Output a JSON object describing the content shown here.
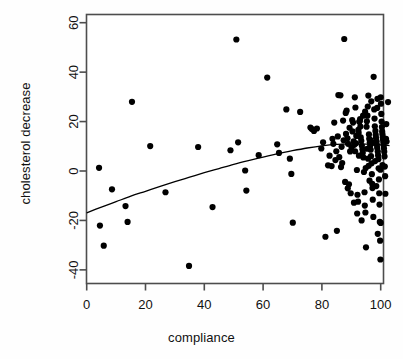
{
  "chart_data": {
    "type": "scatter",
    "title": "",
    "xlabel": "compliance",
    "ylabel": "cholesterol decrease",
    "xlim": [
      -4,
      106
    ],
    "ylim": [
      -45,
      66
    ],
    "xticks": [
      0,
      20,
      40,
      60,
      80,
      100
    ],
    "yticks": [
      -40,
      -20,
      0,
      20,
      40,
      60
    ],
    "grid": false,
    "legend": null,
    "point_color": "#000000",
    "point_size": 3.1,
    "curve_color": "#000000",
    "curve_label": "fitted smooth trend",
    "points": [
      [
        4.2,
        1.3
      ],
      [
        5.8,
        -30.2
      ],
      [
        4.5,
        -22.1
      ],
      [
        8.6,
        -7.4
      ],
      [
        13.2,
        -14.2
      ],
      [
        13.9,
        -20.6
      ],
      [
        15.4,
        28.0
      ],
      [
        21.6,
        10.1
      ],
      [
        26.8,
        -8.6
      ],
      [
        34.8,
        -38.4
      ],
      [
        37.9,
        9.7
      ],
      [
        42.8,
        -14.6
      ],
      [
        48.9,
        8.4
      ],
      [
        50.9,
        53.2
      ],
      [
        51.5,
        11.6
      ],
      [
        53.9,
        0.2
      ],
      [
        54.3,
        -7.9
      ],
      [
        58.5,
        6.4
      ],
      [
        61.4,
        37.8
      ],
      [
        64.8,
        10.8
      ],
      [
        65.4,
        7.3
      ],
      [
        67.9,
        24.9
      ],
      [
        69.1,
        5.0
      ],
      [
        69.6,
        -1.2
      ],
      [
        70.1,
        -20.9
      ],
      [
        72.6,
        23.9
      ],
      [
        76.1,
        17.6
      ],
      [
        76.6,
        17.0
      ],
      [
        77.3,
        16.2
      ],
      [
        78.3,
        17.2
      ],
      [
        79.8,
        9.1
      ],
      [
        80.4,
        11.6
      ],
      [
        81.2,
        -26.6
      ],
      [
        82.1,
        2.3
      ],
      [
        82.6,
        6.2
      ],
      [
        83.3,
        2.0
      ],
      [
        83.9,
        11.0
      ],
      [
        84.2,
        19.6
      ],
      [
        84.6,
        4.4
      ],
      [
        85.1,
        -24.2
      ],
      [
        85.6,
        30.7
      ],
      [
        86.3,
        30.6
      ],
      [
        86.5,
        1.6
      ],
      [
        87.2,
        20.4
      ],
      [
        87.6,
        53.4
      ],
      [
        88.1,
        23.5
      ],
      [
        88.4,
        24.4
      ],
      [
        88.7,
        13.2
      ],
      [
        88.9,
        11.0
      ],
      [
        89.2,
        -5.4
      ],
      [
        89.6,
        7.9
      ],
      [
        90.1,
        9.6
      ],
      [
        90.3,
        20.6
      ],
      [
        90.6,
        19.6
      ],
      [
        90.8,
        12.0
      ],
      [
        91.0,
        10.6
      ],
      [
        91.2,
        29.8
      ],
      [
        91.4,
        25.7
      ],
      [
        91.6,
        11.2
      ],
      [
        91.9,
        0.4
      ],
      [
        92.1,
        -9.6
      ],
      [
        92.3,
        -12.4
      ],
      [
        92.5,
        15.4
      ],
      [
        92.7,
        19.9
      ],
      [
        92.9,
        20.2
      ],
      [
        93.0,
        21.0
      ],
      [
        93.2,
        13.6
      ],
      [
        93.4,
        12.2
      ],
      [
        93.6,
        10.2
      ],
      [
        93.8,
        8.8
      ],
      [
        93.9,
        7.4
      ],
      [
        94.1,
        5.5
      ],
      [
        94.3,
        -0.4
      ],
      [
        94.5,
        -8.6
      ],
      [
        94.6,
        -14.0
      ],
      [
        94.8,
        -16.8
      ],
      [
        95.0,
        -30.9
      ],
      [
        95.2,
        17.9
      ],
      [
        95.3,
        20.1
      ],
      [
        95.5,
        22.4
      ],
      [
        95.6,
        26.1
      ],
      [
        95.8,
        30.5
      ],
      [
        96.0,
        14.8
      ],
      [
        96.1,
        13.0
      ],
      [
        96.3,
        11.6
      ],
      [
        96.4,
        10.1
      ],
      [
        96.6,
        8.6
      ],
      [
        96.7,
        6.0
      ],
      [
        96.9,
        3.1
      ],
      [
        97.0,
        -1.3
      ],
      [
        97.2,
        -6.9
      ],
      [
        97.3,
        -11.6
      ],
      [
        97.5,
        -18.6
      ],
      [
        97.6,
        38.1
      ],
      [
        97.8,
        24.9
      ],
      [
        97.9,
        21.2
      ],
      [
        98.0,
        18.1
      ],
      [
        98.2,
        16.2
      ],
      [
        98.3,
        14.6
      ],
      [
        98.4,
        13.4
      ],
      [
        98.6,
        12.0
      ],
      [
        98.7,
        10.6
      ],
      [
        98.8,
        9.4
      ],
      [
        99.0,
        7.9
      ],
      [
        99.1,
        6.4
      ],
      [
        99.2,
        4.8
      ],
      [
        99.3,
        1.1
      ],
      [
        99.4,
        -3.4
      ],
      [
        99.5,
        -9.0
      ],
      [
        99.6,
        -13.6
      ],
      [
        99.7,
        -20.6
      ],
      [
        99.8,
        -28.2
      ],
      [
        99.9,
        -35.8
      ],
      [
        100.0,
        29.8
      ],
      [
        100.1,
        27.2
      ],
      [
        100.2,
        23.1
      ],
      [
        100.3,
        20.0
      ],
      [
        100.4,
        17.8
      ],
      [
        100.5,
        16.0
      ],
      [
        100.6,
        14.9
      ],
      [
        100.7,
        13.7
      ],
      [
        100.8,
        12.6
      ],
      [
        100.9,
        11.5
      ],
      [
        101.0,
        10.4
      ],
      [
        101.1,
        9.2
      ],
      [
        101.2,
        7.8
      ],
      [
        101.3,
        5.9
      ],
      [
        101.4,
        1.8
      ],
      [
        101.5,
        -2.1
      ],
      [
        101.6,
        -9.2
      ],
      [
        102.5,
        27.9
      ],
      [
        98.9,
        29.2
      ],
      [
        96.8,
        28.2
      ],
      [
        95.9,
        2.1
      ],
      [
        94.9,
        1.2
      ],
      [
        93.5,
        -20.0
      ],
      [
        92.0,
        -17.2
      ],
      [
        90.9,
        -12.8
      ],
      [
        89.8,
        -9.0
      ],
      [
        88.8,
        -7.0
      ],
      [
        87.9,
        -4.4
      ],
      [
        86.9,
        3.2
      ],
      [
        85.9,
        5.6
      ],
      [
        84.9,
        8.0
      ],
      [
        91.7,
        14.2
      ],
      [
        92.4,
        16.6
      ],
      [
        93.1,
        18.0
      ],
      [
        94.0,
        22.4
      ],
      [
        94.7,
        24.0
      ],
      [
        95.4,
        9.0
      ],
      [
        96.2,
        -3.9
      ],
      [
        97.1,
        -5.2
      ],
      [
        98.5,
        -6.1
      ],
      [
        99.9,
        0.5
      ],
      [
        100.6,
        2.4
      ],
      [
        101.8,
        13.0
      ],
      [
        89.4,
        17.5
      ],
      [
        90.4,
        16.0
      ],
      [
        91.3,
        8.0
      ],
      [
        92.6,
        6.2
      ],
      [
        95.7,
        5.0
      ],
      [
        96.5,
        12.5
      ],
      [
        97.7,
        11.4
      ],
      [
        98.1,
        4.0
      ],
      [
        86.7,
        9.8
      ],
      [
        87.4,
        12.4
      ],
      [
        88.2,
        15.0
      ],
      [
        85.4,
        14.0
      ],
      [
        83.6,
        13.0
      ],
      [
        99.0,
        -25.4
      ],
      [
        100.0,
        -21.0
      ],
      [
        98.8,
        25.5
      ],
      [
        101.9,
        19.0
      ],
      [
        102.0,
        11.9
      ]
    ],
    "curve": [
      [
        0,
        -16.9
      ],
      [
        5,
        -14.6
      ],
      [
        10,
        -12.4
      ],
      [
        15,
        -10.2
      ],
      [
        20,
        -8.2
      ],
      [
        25,
        -6.2
      ],
      [
        30,
        -4.3
      ],
      [
        35,
        -2.5
      ],
      [
        40,
        -0.7
      ],
      [
        45,
        1.0
      ],
      [
        50,
        2.7
      ],
      [
        55,
        4.2
      ],
      [
        60,
        5.6
      ],
      [
        65,
        7.0
      ],
      [
        70,
        8.2
      ],
      [
        75,
        9.3
      ],
      [
        80,
        10.2
      ],
      [
        85,
        10.8
      ],
      [
        90,
        11.0
      ],
      [
        95,
        10.9
      ],
      [
        100,
        10.6
      ],
      [
        103,
        10.3
      ]
    ]
  }
}
